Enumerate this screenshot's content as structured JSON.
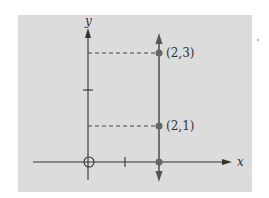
{
  "diagram": {
    "axes": {
      "x_label": "x",
      "y_label": "y"
    },
    "points": [
      {
        "label": "(2,3)",
        "x": 2,
        "y": 3
      },
      {
        "label": "(2,1)",
        "x": 2,
        "y": 1
      },
      {
        "label": "",
        "x": 2,
        "y": 0
      }
    ],
    "vertical_line_x": 2,
    "colors": {
      "panel": "#dcdcdc",
      "axis": "#333333",
      "line": "#555555",
      "point": "#666666"
    }
  }
}
